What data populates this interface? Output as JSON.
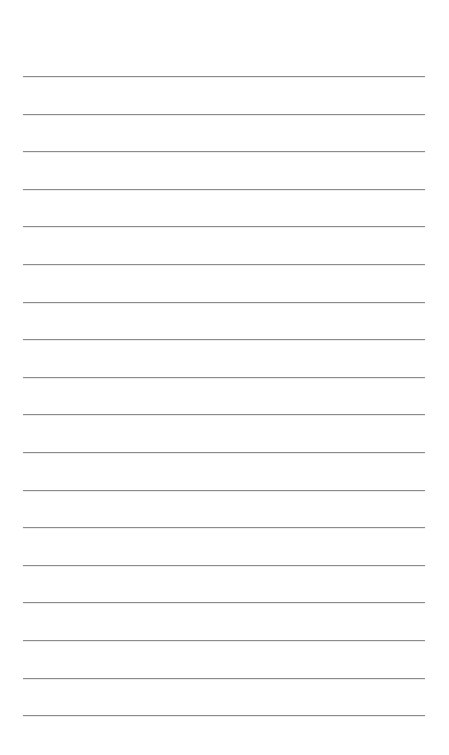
{
  "page": {
    "type": "ruled-notepaper",
    "background_color": "#ffffff",
    "line_color": "#8c8c8c",
    "line_count": 18,
    "first_line_y": 76,
    "line_spacing": 37.6,
    "line_left": 23,
    "line_right": 425,
    "lines": [
      {
        "text": ""
      },
      {
        "text": ""
      },
      {
        "text": ""
      },
      {
        "text": ""
      },
      {
        "text": ""
      },
      {
        "text": ""
      },
      {
        "text": ""
      },
      {
        "text": ""
      },
      {
        "text": ""
      },
      {
        "text": ""
      },
      {
        "text": ""
      },
      {
        "text": ""
      },
      {
        "text": ""
      },
      {
        "text": ""
      },
      {
        "text": ""
      },
      {
        "text": ""
      },
      {
        "text": ""
      },
      {
        "text": ""
      }
    ]
  }
}
